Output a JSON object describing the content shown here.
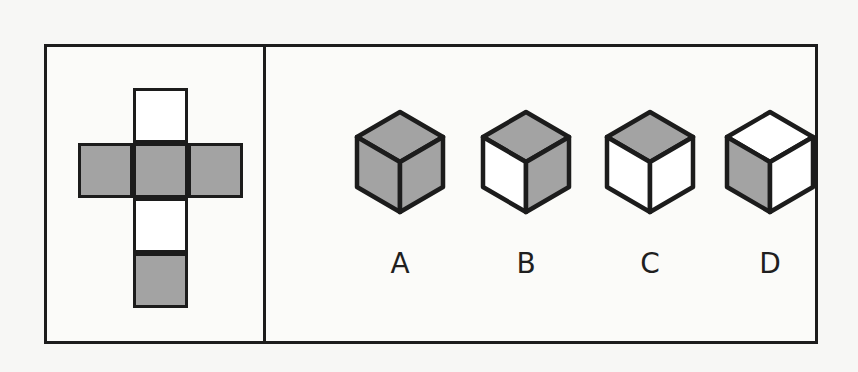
{
  "figure": {
    "background_color": "#f7f7f5",
    "border_color": "#1c1c1c",
    "shaded_color": "#a3a3a3",
    "blank_color": "#ffffff"
  },
  "net": {
    "shape": "cross",
    "cell_count": 6,
    "cells": [
      {
        "id": "top",
        "position": "top",
        "fill": "white",
        "fill_color": "#ffffff"
      },
      {
        "id": "left",
        "position": "middle-left",
        "fill": "gray",
        "fill_color": "#a3a3a3"
      },
      {
        "id": "mid",
        "position": "middle-center",
        "fill": "gray",
        "fill_color": "#a3a3a3"
      },
      {
        "id": "right",
        "position": "middle-right",
        "fill": "gray",
        "fill_color": "#a3a3a3"
      },
      {
        "id": "under",
        "position": "lower-center",
        "fill": "white",
        "fill_color": "#ffffff"
      },
      {
        "id": "bottom",
        "position": "bottom-center",
        "fill": "gray",
        "fill_color": "#a3a3a3"
      }
    ]
  },
  "options": [
    {
      "label": "A",
      "faces": {
        "top": "gray",
        "left": "gray",
        "right": "gray"
      },
      "face_colors": {
        "top": "#a3a3a3",
        "left": "#a3a3a3",
        "right": "#a3a3a3"
      }
    },
    {
      "label": "B",
      "faces": {
        "top": "gray",
        "left": "white",
        "right": "gray"
      },
      "face_colors": {
        "top": "#a3a3a3",
        "left": "#ffffff",
        "right": "#a3a3a3"
      }
    },
    {
      "label": "C",
      "faces": {
        "top": "gray",
        "left": "white",
        "right": "white"
      },
      "face_colors": {
        "top": "#a3a3a3",
        "left": "#ffffff",
        "right": "#ffffff"
      }
    },
    {
      "label": "D",
      "faces": {
        "top": "white",
        "left": "gray",
        "right": "white"
      },
      "face_colors": {
        "top": "#ffffff",
        "left": "#a3a3a3",
        "right": "#ffffff"
      }
    }
  ]
}
